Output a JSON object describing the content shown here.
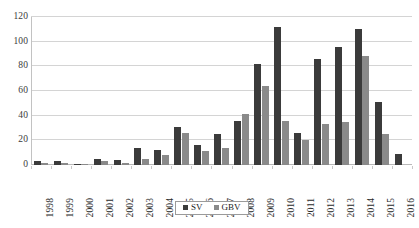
{
  "chart_data": {
    "type": "bar",
    "title": "",
    "xlabel": "",
    "ylabel": "",
    "ylim": [
      0,
      120
    ],
    "ytick_step": 20,
    "yticks": [
      0,
      20,
      40,
      60,
      80,
      100,
      120
    ],
    "grid": "horizontal",
    "legend_position": "bottom-center",
    "categories": [
      "1998",
      "1999",
      "2000",
      "2001",
      "2002",
      "2003",
      "2004",
      "2005",
      "2006",
      "2007",
      "2008",
      "2009",
      "2010",
      "2011",
      "2012",
      "2013",
      "2014",
      "2015",
      "2016"
    ],
    "series": [
      {
        "name": "SV",
        "color": "#3b3b3b",
        "values": [
          3,
          3,
          1,
          5,
          4,
          14,
          12,
          31,
          16,
          25,
          36,
          82,
          112,
          26,
          86,
          96,
          110,
          51,
          9
        ]
      },
      {
        "name": "GBV",
        "color": "#8a8a8a",
        "values": [
          2,
          2,
          1,
          3,
          2,
          5,
          8,
          26,
          11,
          14,
          41,
          64,
          36,
          20,
          33,
          35,
          88,
          25,
          0
        ]
      }
    ]
  },
  "legend": {
    "items": [
      {
        "label": "SV",
        "swatch": "sv"
      },
      {
        "label": "GBV",
        "swatch": "gbv"
      }
    ]
  }
}
